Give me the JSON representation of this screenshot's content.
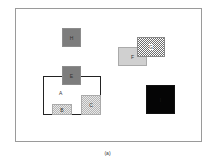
{
  "figure": {
    "caption": "(a)",
    "shapes": {
      "A": {
        "label": "A"
      },
      "B": {
        "label": "B"
      },
      "C": {
        "label": "C"
      },
      "E": {
        "label": "E"
      },
      "F": {
        "label": "F"
      },
      "G": {
        "label": "G"
      },
      "H": {
        "label": "H"
      },
      "I": {
        "label": "I"
      }
    }
  }
}
